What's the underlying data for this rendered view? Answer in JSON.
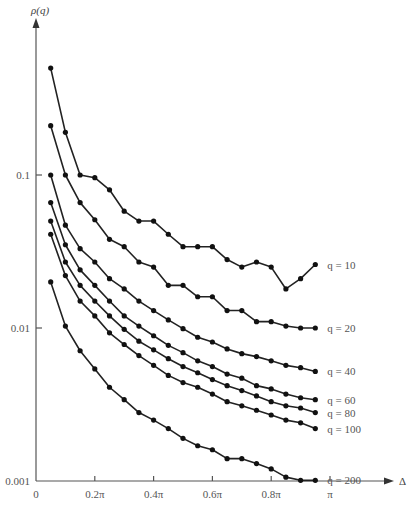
{
  "chart_data": {
    "type": "line",
    "title": "",
    "xlabel": "Δ",
    "ylabel": "ρ(q)",
    "yscale": "log",
    "ylim": [
      0.001,
      0.6
    ],
    "xlim": [
      0,
      1.15
    ],
    "x_unit": "π",
    "grid": false,
    "legend_position": "inline-right",
    "x_ticks": [
      {
        "value": 0,
        "label": "0"
      },
      {
        "value": 0.2,
        "label": "0.2π"
      },
      {
        "value": 0.4,
        "label": "0.4π"
      },
      {
        "value": 0.6,
        "label": "0.6π"
      },
      {
        "value": 0.8,
        "label": "0.8π"
      },
      {
        "value": 1.0,
        "label": "π"
      }
    ],
    "y_ticks": [
      {
        "value": 0.1,
        "label": "0.1"
      },
      {
        "value": 0.01,
        "label": "0.01"
      },
      {
        "value": 0.001,
        "label": "0.001"
      }
    ],
    "x": [
      0.05,
      0.1,
      0.15,
      0.2,
      0.25,
      0.3,
      0.35,
      0.4,
      0.45,
      0.5,
      0.55,
      0.6,
      0.65,
      0.7,
      0.75,
      0.8,
      0.85,
      0.9,
      0.95
    ],
    "series": [
      {
        "name": "q = 10",
        "values": [
          0.5,
          0.19,
          0.1,
          0.096,
          0.08,
          0.058,
          0.05,
          0.05,
          0.041,
          0.034,
          0.034,
          0.034,
          0.028,
          0.025,
          0.027,
          0.025,
          0.018,
          0.021,
          0.026
        ]
      },
      {
        "name": "q = 20",
        "values": [
          0.21,
          0.1,
          0.066,
          0.051,
          0.038,
          0.034,
          0.027,
          0.025,
          0.019,
          0.019,
          0.016,
          0.016,
          0.013,
          0.013,
          0.011,
          0.011,
          0.0103,
          0.01,
          0.01
        ]
      },
      {
        "name": "q = 40",
        "values": [
          0.1,
          0.047,
          0.033,
          0.027,
          0.021,
          0.018,
          0.015,
          0.013,
          0.0113,
          0.0099,
          0.0087,
          0.0081,
          0.0073,
          0.0068,
          0.0065,
          0.0061,
          0.0057,
          0.0055,
          0.0052
        ]
      },
      {
        "name": "q = 60",
        "values": [
          0.066,
          0.035,
          0.024,
          0.019,
          0.015,
          0.012,
          0.0103,
          0.0089,
          0.0077,
          0.0069,
          0.0061,
          0.0056,
          0.005,
          0.0047,
          0.0042,
          0.004,
          0.0037,
          0.0035,
          0.0034
        ]
      },
      {
        "name": "q = 80",
        "values": [
          0.05,
          0.027,
          0.019,
          0.015,
          0.012,
          0.0098,
          0.0082,
          0.0072,
          0.0063,
          0.0056,
          0.0051,
          0.0046,
          0.0042,
          0.0039,
          0.0036,
          0.0033,
          0.0031,
          0.003,
          0.0028
        ]
      },
      {
        "name": "q = 100",
        "values": [
          0.041,
          0.022,
          0.015,
          0.012,
          0.0093,
          0.0078,
          0.0066,
          0.0057,
          0.0049,
          0.0044,
          0.0041,
          0.0037,
          0.0033,
          0.0031,
          0.0029,
          0.0027,
          0.0025,
          0.0024,
          0.0022
        ]
      },
      {
        "name": "q = 200",
        "values": [
          0.02,
          0.0103,
          0.0071,
          0.0054,
          0.0041,
          0.0034,
          0.0028,
          0.0025,
          0.0022,
          0.0019,
          0.0017,
          0.0016,
          0.0014,
          0.0014,
          0.0013,
          0.0012,
          0.00106,
          0.00101,
          0.00101
        ]
      }
    ]
  }
}
